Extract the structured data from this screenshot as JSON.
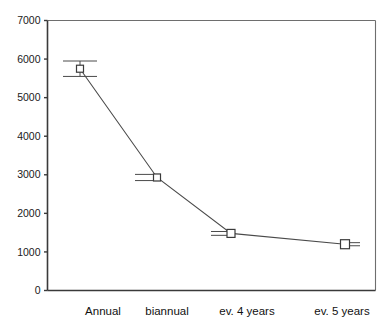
{
  "chart_data": {
    "type": "line",
    "title": "",
    "subtitle": "",
    "xlabel": "",
    "ylabel": "",
    "categories": [
      "Annual",
      "biannual",
      "ev. 4 years",
      "ev. 5 years"
    ],
    "values": [
      5750,
      2930,
      1480,
      1200
    ],
    "error_upper": [
      200,
      80,
      50,
      40
    ],
    "error_lower": [
      200,
      80,
      50,
      40
    ],
    "ylim": [
      0,
      7000
    ],
    "ytick_labels": [
      "0",
      "1000",
      "2000",
      "3000",
      "4000",
      "5000",
      "6000",
      "7000"
    ],
    "ytick_values": [
      0,
      1000,
      2000,
      3000,
      4000,
      5000,
      6000,
      7000
    ],
    "grid": false,
    "legend": false,
    "legend_position": "none",
    "marker": "open-square",
    "annotations": []
  },
  "axis": {
    "y_axis_name": "y-axis",
    "x_axis_name": "x-axis"
  },
  "colors": {
    "background": "#ffffff",
    "line": "#4a4a4a",
    "marker_fill": "#ffffff",
    "marker_stroke": "#3a3a3a",
    "axis": "#3a3a3a",
    "frame": "#6e6e6e",
    "text": "#111111"
  }
}
